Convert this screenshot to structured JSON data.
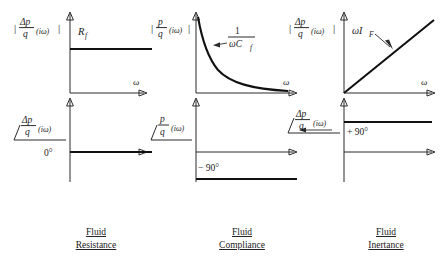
{
  "figure": {
    "title_present": false,
    "background": "#ffffff",
    "ink_color": "#1a1a1a",
    "curve_color": "#111111"
  },
  "axis_symbol": {
    "omega": "ω",
    "magnitude_bar": "|",
    "angle_sign": "∠"
  },
  "panels": [
    {
      "id": "fluid-resistance",
      "caption_line1": "Fluid",
      "caption_line2": "Resistance",
      "magnitude": {
        "ylabel_num": "Δp",
        "ylabel_den": "q",
        "ylabel_arg": "(iω)",
        "ylabel_full": "|Δp/q (iω)|",
        "xlabel": "ω",
        "curve_type": "constant",
        "curve_label": "R",
        "curve_label_sub": "f",
        "curve_label_full": "R_f",
        "level": "constant R_f"
      },
      "phase": {
        "ylabel_num": "Δp",
        "ylabel_den": "q",
        "ylabel_arg": "(iω)",
        "ylabel_full": "∠ Δp/q (iω)",
        "xlabel": "",
        "curve_type": "constant",
        "value_label": "0°",
        "value_deg": 0
      }
    },
    {
      "id": "fluid-compliance",
      "caption_line1": "Fluid",
      "caption_line2": "Compliance",
      "magnitude": {
        "ylabel_num": "p",
        "ylabel_den": "q",
        "ylabel_arg": "(iω)",
        "ylabel_full": "|p/q (iω)|",
        "xlabel": "ω",
        "curve_type": "hyperbolic-decay",
        "curve_label_num": "1",
        "curve_label_den": "ωC",
        "curve_label_den_sub": "f",
        "curve_label_full": "1/(ωC_f)",
        "has_leader_arrow": true
      },
      "phase": {
        "ylabel_num": "p",
        "ylabel_den": "q",
        "ylabel_arg": "(iω)",
        "ylabel_full": "∠ p/q (iω)",
        "xlabel": "",
        "curve_type": "constant",
        "value_label": "− 90°",
        "value_deg": -90
      }
    },
    {
      "id": "fluid-inertance",
      "caption_line1": "Fluid",
      "caption_line2": "Inertance",
      "magnitude": {
        "ylabel_num": "Δp",
        "ylabel_den": "q",
        "ylabel_arg": "(iω)",
        "ylabel_full": "|Δp/q (iω)|",
        "xlabel": "ω",
        "curve_type": "linear-rising",
        "curve_label": "ωI",
        "curve_label_sub": "F",
        "curve_label_full": "ωI_F",
        "has_leader_arrow": true
      },
      "phase": {
        "ylabel_num": "Δp",
        "ylabel_den": "q",
        "ylabel_arg": "(iω)",
        "ylabel_full": "∠ Δp/q (iω)",
        "xlabel": "",
        "curve_type": "constant",
        "value_label": "+ 90°",
        "value_deg": 90
      }
    }
  ]
}
